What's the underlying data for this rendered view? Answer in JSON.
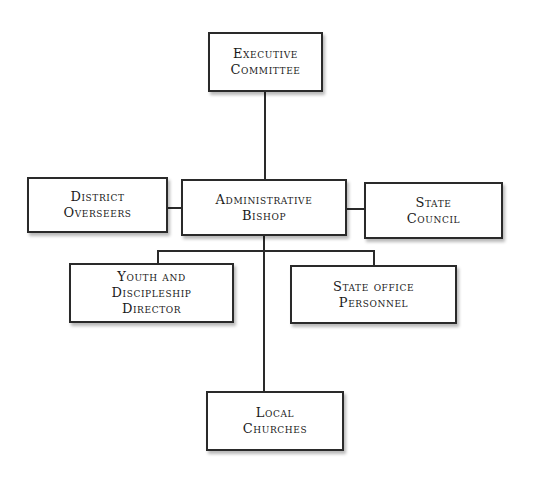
{
  "diagram": {
    "type": "org-chart",
    "nodes": [
      {
        "id": "executive-committee",
        "lines": [
          "Executive",
          "Committee"
        ]
      },
      {
        "id": "district-overseers",
        "lines": [
          "District",
          "Overseers"
        ]
      },
      {
        "id": "administrative-bishop",
        "lines": [
          "Administrative",
          "Bishop"
        ]
      },
      {
        "id": "state-council",
        "lines": [
          "State",
          "Council"
        ]
      },
      {
        "id": "youth-discipleship-director",
        "lines": [
          "Youth and",
          "Discipleship",
          "Director"
        ]
      },
      {
        "id": "state-office-personnel",
        "lines": [
          "State Office",
          "Personnel"
        ]
      },
      {
        "id": "local-churches",
        "lines": [
          "Local",
          "Churches"
        ]
      }
    ],
    "edges": [
      [
        "executive-committee",
        "administrative-bishop"
      ],
      [
        "district-overseers",
        "administrative-bishop"
      ],
      [
        "administrative-bishop",
        "state-council"
      ],
      [
        "administrative-bishop",
        "youth-discipleship-director"
      ],
      [
        "administrative-bishop",
        "state-office-personnel"
      ],
      [
        "administrative-bishop",
        "local-churches"
      ]
    ],
    "colors": {
      "line": "#2a2a2a",
      "box_fill": "#ffffff",
      "text": "#1a1a1a"
    }
  }
}
